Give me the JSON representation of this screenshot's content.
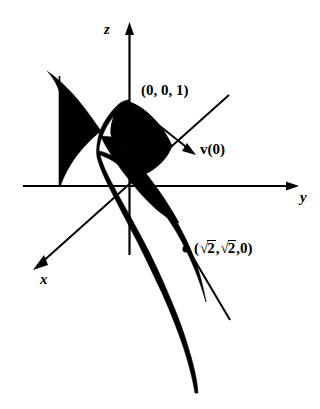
{
  "figure": {
    "kind": "3d-coordinate-sketch",
    "background_color": "#ffffff",
    "ink_color": "#000000",
    "axes": [
      {
        "name": "z",
        "label": "z",
        "direction": "up",
        "arrow": true
      },
      {
        "name": "y",
        "label": "y",
        "direction": "right",
        "arrow": true
      },
      {
        "name": "x",
        "label": "x",
        "direction": "down-left",
        "arrow": true
      }
    ],
    "labels": {
      "z_axis": "z",
      "y_axis": "y",
      "x_axis": "x",
      "apex_point": "(0, 0, 1)",
      "velocity_vector": "v(0)",
      "velocity_vector_symbol": "v",
      "velocity_vector_arg": "(0)",
      "base_point_open": "(",
      "base_point_radical_sign": "√",
      "base_point_radicand": "2",
      "base_point_comma": ",",
      "base_point_zero": "0",
      "base_point_close": ")",
      "base_point_full": "(√2, √2, 0)"
    },
    "annotations": [
      {
        "name": "marked-point",
        "label": "(√2, √2, 0)",
        "shape": "filled-dot"
      },
      {
        "name": "apex-label",
        "label": "(0, 0, 1)"
      },
      {
        "name": "velocity-arrow",
        "label": "v(0)",
        "shape": "arrow"
      }
    ],
    "shading": {
      "fill": "#000000",
      "regions": [
        "left-lobe",
        "main-lobe",
        "lower-tail"
      ]
    }
  }
}
